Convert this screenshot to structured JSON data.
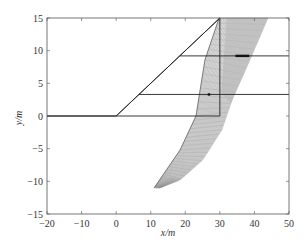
{
  "chart_data": {
    "type": "line",
    "title": "",
    "xlabel": "x/m",
    "ylabel": "y/m",
    "xlim": [
      -20,
      50
    ],
    "ylim": [
      -15,
      15
    ],
    "grid": false,
    "xticks": [
      -20,
      -10,
      0,
      10,
      20,
      30,
      40,
      50
    ],
    "yticks": [
      -15,
      -10,
      -5,
      0,
      5,
      10,
      15
    ],
    "xtick_labels": [
      "−20",
      "−10",
      "0",
      "10",
      "20",
      "30",
      "40",
      "50"
    ],
    "ytick_labels": [
      "−15",
      "−10",
      "−5",
      "0",
      "5",
      "10",
      "15"
    ],
    "series": [
      {
        "name": "ground-surface",
        "color": "#222222",
        "x": [
          -20,
          0,
          30,
          30
        ],
        "y": [
          0,
          0,
          15,
          15
        ]
      },
      {
        "name": "slope-face",
        "color": "#222222",
        "x": [
          0,
          30
        ],
        "y": [
          0,
          15
        ]
      },
      {
        "name": "vertical-boundary",
        "color": "#222222",
        "x": [
          30,
          30
        ],
        "y": [
          15,
          0
        ]
      },
      {
        "name": "base-line",
        "color": "#222222",
        "x": [
          -20,
          30
        ],
        "y": [
          0,
          0
        ]
      },
      {
        "name": "layer-line-lower",
        "color": "#222222",
        "x": [
          6.6,
          50
        ],
        "y": [
          3.3,
          3.3
        ]
      },
      {
        "name": "layer-line-upper",
        "color": "#222222",
        "x": [
          18.4,
          50
        ],
        "y": [
          9.2,
          9.2
        ]
      }
    ],
    "slip_mesh": {
      "name": "slip-surface-mesh",
      "color": "#888888",
      "left_edge": {
        "x": [
          29.8,
          25.7,
          23.1,
          18.5,
          14.1,
          11.0
        ],
        "y": [
          15,
          8.6,
          0,
          -5.2,
          -8.6,
          -11.0
        ]
      },
      "right_edge": {
        "x": [
          43.9,
          38.7,
          33.5,
          30.6,
          25.1,
          18.5,
          12.7
        ],
        "y": [
          15,
          8.6,
          2.4,
          -2.1,
          -6.7,
          -9.8,
          -11.0
        ]
      }
    },
    "markers": [
      {
        "name": "upper-layer-marker",
        "x": [
          34.5,
          38.5
        ],
        "y": [
          9.2,
          9.2
        ]
      },
      {
        "name": "lower-layer-marker",
        "x": [
          26.5,
          27.2
        ],
        "y": [
          3.3,
          3.3
        ]
      }
    ]
  }
}
